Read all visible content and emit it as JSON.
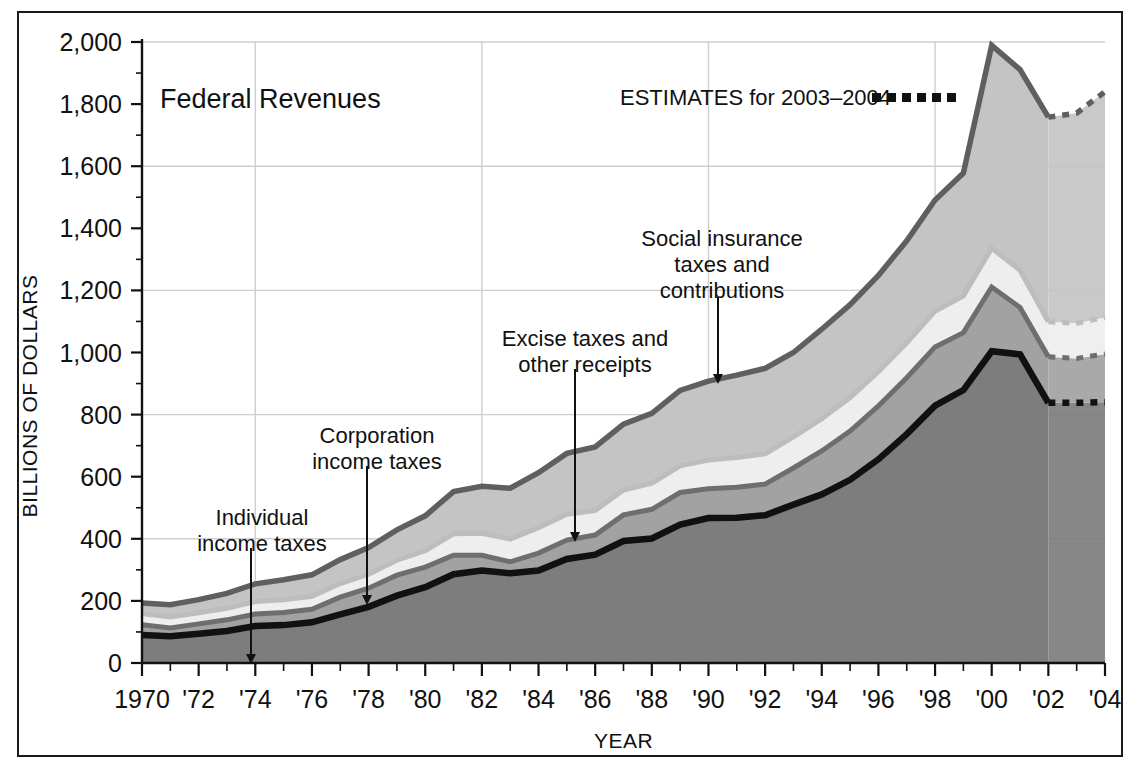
{
  "chart_data": {
    "type": "area",
    "title": "Federal Revenues",
    "xlabel": "YEAR",
    "ylabel": "BILLIONS OF DOLLARS",
    "xlim": [
      1970,
      2004
    ],
    "ylim": [
      0,
      2000
    ],
    "ytick_step": 200,
    "yminor_step": 100,
    "grid": true,
    "gridlines_y": [
      400,
      800,
      1200,
      1600,
      2000
    ],
    "gridlines_x": [
      1974,
      1982,
      1990,
      1998
    ],
    "legend_position": "top-right",
    "stacked": true,
    "x": [
      1970,
      1971,
      1972,
      1973,
      1974,
      1975,
      1976,
      1977,
      1978,
      1979,
      1980,
      1981,
      1982,
      1983,
      1984,
      1985,
      1986,
      1987,
      1988,
      1989,
      1990,
      1991,
      1992,
      1993,
      1994,
      1995,
      1996,
      1997,
      1998,
      1999,
      2000,
      2001,
      2002,
      2003,
      2004
    ],
    "estimate_years": [
      2002,
      2003,
      2004
    ],
    "ytick_labels": [
      "0",
      "200",
      "400",
      "600",
      "800",
      "1,000",
      "1,200",
      "1,400",
      "1,600",
      "1,800",
      "2,000"
    ],
    "xtick_labels": [
      "1970",
      "'72",
      "'74",
      "'76",
      "'78",
      "'80",
      "'82",
      "'84",
      "'86",
      "'88",
      "'90",
      "'92",
      "'94",
      "'96",
      "'98",
      "'00",
      "'02",
      "'04"
    ],
    "series": [
      {
        "name": "Individual income taxes",
        "color": "#7d7d7d",
        "border_color": "#111111",
        "values": [
          90,
          86,
          94,
          103,
          119,
          122,
          131,
          157,
          181,
          217,
          244,
          286,
          298,
          289,
          298,
          335,
          349,
          393,
          401,
          446,
          467,
          468,
          476,
          510,
          543,
          590,
          656,
          737,
          829,
          879,
          1004,
          994,
          838,
          838,
          840
        ]
      },
      {
        "name": "Corporation income taxes",
        "color": "#a2a2a2",
        "border_color": "#6e6e6e",
        "values": [
          33,
          27,
          32,
          36,
          39,
          41,
          42,
          55,
          60,
          66,
          65,
          61,
          49,
          37,
          56,
          61,
          63,
          84,
          94,
          103,
          94,
          98,
          100,
          118,
          140,
          157,
          172,
          182,
          189,
          185,
          207,
          151,
          148,
          143,
          155
        ]
      },
      {
        "name": "Excise taxes and other receipts",
        "color": "#eeeeee",
        "border_color": "#bdbdbd",
        "values": [
          36,
          35,
          36,
          37,
          40,
          41,
          42,
          44,
          45,
          48,
          53,
          69,
          71,
          73,
          82,
          83,
          79,
          80,
          84,
          86,
          93,
          96,
          98,
          100,
          104,
          108,
          110,
          112,
          115,
          118,
          125,
          120,
          113,
          113,
          118
        ]
      },
      {
        "name": "Social insurance taxes and contributions",
        "color": "#c4c4c4",
        "border_color": "#5f5f5f",
        "values": [
          34,
          40,
          42,
          48,
          57,
          64,
          69,
          77,
          86,
          98,
          112,
          136,
          151,
          164,
          177,
          196,
          205,
          212,
          225,
          243,
          254,
          265,
          275,
          272,
          288,
          299,
          310,
          329,
          358,
          396,
          653,
          646,
          659,
          677,
          727
        ]
      }
    ],
    "totals_note": [
      193,
      188,
      204,
      224,
      255,
      268,
      284,
      333,
      372,
      429,
      474,
      552,
      569,
      563,
      613,
      675,
      696,
      769,
      804,
      878,
      908,
      927,
      949,
      1000,
      1075,
      1154,
      1248,
      1360,
      1491,
      1578,
      1989,
      1911,
      1758,
      1771,
      1840
    ]
  },
  "annotations": [
    {
      "id": "individual-income-taxes",
      "lines": [
        "Individual",
        "income taxes"
      ],
      "text_x": 262,
      "text_y": 525,
      "arrow_x": 251,
      "arrow_y1": 548,
      "arrow_y2": 662
    },
    {
      "id": "corporation-income-taxes",
      "lines": [
        "Corporation",
        "income taxes"
      ],
      "text_x": 377,
      "text_y": 443,
      "arrow_x": 367,
      "arrow_y1": 466,
      "arrow_y2": 603
    },
    {
      "id": "excise-taxes-and-other-receipts",
      "lines": [
        "Excise taxes and",
        "other receipts"
      ],
      "text_x": 585,
      "text_y": 346,
      "arrow_x": 575,
      "arrow_y1": 369,
      "arrow_y2": 540
    },
    {
      "id": "social-insurance-taxes-and-contributions",
      "lines": [
        "Social insurance",
        "taxes and",
        "contributions"
      ],
      "text_x": 722,
      "text_y": 246,
      "arrow_x": 718,
      "arrow_y1": 297,
      "arrow_y2": 382
    }
  ],
  "legend": {
    "estimates_label": "ESTIMATES for 2003–2004",
    "estimates_marker": "dotted-line-marker",
    "x": 620,
    "y": 105
  },
  "title": {
    "text": "Federal Revenues",
    "x": 160,
    "y": 108
  },
  "colors": {
    "frame": "#1a1a1a",
    "grid": "#cfcfcf",
    "axis": "#111111",
    "individual": "#7d7d7d",
    "corporation": "#a2a2a2",
    "excise": "#eeeeee",
    "social": "#c4c4c4",
    "background": "#ffffff"
  }
}
